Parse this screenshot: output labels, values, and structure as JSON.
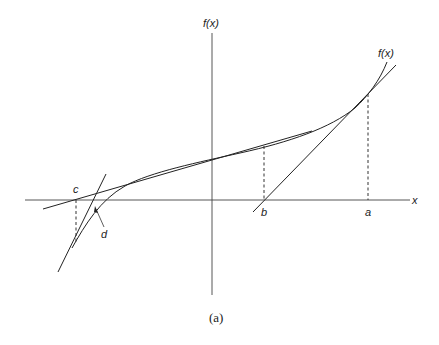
{
  "figure": {
    "caption": "(a)",
    "y_axis_label": "f(x)",
    "x_axis_label": "x",
    "curve_label": "f(x)",
    "points": {
      "a": "a",
      "b": "b",
      "c": "c",
      "d": "d"
    }
  }
}
